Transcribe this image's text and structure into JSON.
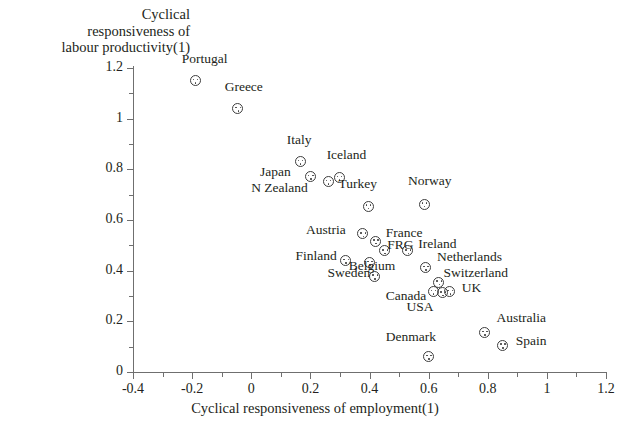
{
  "chart_data": {
    "type": "scatter",
    "title": "",
    "xlabel": "Cyclical responsiveness of employment(1)",
    "ylabel": "Cyclical\nresponsiveness of\nlabour productivity(1)",
    "xlim": [
      -0.4,
      1.2
    ],
    "ylim": [
      0,
      1.2
    ],
    "xticks": [
      "-0.4",
      "-0.2",
      "0",
      "0.2",
      "0.4",
      "0.6",
      "0.8",
      "1",
      "1.2"
    ],
    "xtick_values": [
      -0.4,
      -0.2,
      0,
      0.2,
      0.4,
      0.6,
      0.8,
      1,
      1.2
    ],
    "yticks": [
      "0",
      "0.2",
      "0.4",
      "0.6",
      "0.8",
      "1",
      "1.2"
    ],
    "ytick_values": [
      0,
      0.2,
      0.4,
      0.6,
      0.8,
      1,
      1.2
    ],
    "minor_ticks": true,
    "grid": false,
    "legend": false,
    "marker": "circle-with-three-dots",
    "points": [
      {
        "label": "Portugal",
        "x": -0.19,
        "y": 1.15,
        "lx": -0.235,
        "ly": 1.235,
        "anchor": "start"
      },
      {
        "label": "Greece",
        "x": -0.045,
        "y": 1.04,
        "lx": -0.09,
        "ly": 1.125,
        "anchor": "start"
      },
      {
        "label": "Italy",
        "x": 0.165,
        "y": 0.83,
        "lx": 0.12,
        "ly": 0.915,
        "anchor": "start"
      },
      {
        "label": "Japan",
        "x": 0.2,
        "y": 0.772,
        "lx": 0.03,
        "ly": 0.79,
        "anchor": "start"
      },
      {
        "label": "N Zealand",
        "x": 0.26,
        "y": 0.752,
        "lx": 0.0,
        "ly": 0.726,
        "anchor": "start"
      },
      {
        "label": "Iceland",
        "x": 0.297,
        "y": 0.768,
        "lx": 0.255,
        "ly": 0.855,
        "anchor": "start"
      },
      {
        "label": "Turkey",
        "x": 0.395,
        "y": 0.655,
        "lx": 0.295,
        "ly": 0.742,
        "anchor": "start"
      },
      {
        "label": "Norway",
        "x": 0.585,
        "y": 0.663,
        "lx": 0.53,
        "ly": 0.752,
        "anchor": "start"
      },
      {
        "label": "Austria",
        "x": 0.378,
        "y": 0.545,
        "lx": 0.185,
        "ly": 0.562,
        "anchor": "start"
      },
      {
        "label": "France",
        "x": 0.42,
        "y": 0.517,
        "lx": 0.455,
        "ly": 0.548,
        "anchor": "start"
      },
      {
        "label": "FRG",
        "x": 0.452,
        "y": 0.478,
        "lx": 0.46,
        "ly": 0.502,
        "anchor": "start"
      },
      {
        "label": "Ireland",
        "x": 0.53,
        "y": 0.478,
        "lx": 0.565,
        "ly": 0.505,
        "anchor": "start"
      },
      {
        "label": "Finland",
        "x": 0.32,
        "y": 0.44,
        "lx": 0.15,
        "ly": 0.456,
        "anchor": "start"
      },
      {
        "label": "Belgium",
        "x": 0.4,
        "y": 0.432,
        "lx": 0.33,
        "ly": 0.42,
        "anchor": "start"
      },
      {
        "label": "Sweden",
        "x": 0.418,
        "y": 0.378,
        "lx": 0.258,
        "ly": 0.39,
        "anchor": "start"
      },
      {
        "label": "Netherlands",
        "x": 0.59,
        "y": 0.412,
        "lx": 0.628,
        "ly": 0.452,
        "anchor": "start"
      },
      {
        "label": "Switzerland",
        "x": 0.635,
        "y": 0.355,
        "lx": 0.65,
        "ly": 0.392,
        "anchor": "start"
      },
      {
        "label": "Canada",
        "x": 0.615,
        "y": 0.318,
        "lx": 0.455,
        "ly": 0.3,
        "anchor": "start"
      },
      {
        "label": "USA",
        "x": 0.648,
        "y": 0.312,
        "lx": 0.525,
        "ly": 0.258,
        "anchor": "start"
      },
      {
        "label": "UK",
        "x": 0.672,
        "y": 0.318,
        "lx": 0.712,
        "ly": 0.332,
        "anchor": "start"
      },
      {
        "label": "Denmark",
        "x": 0.6,
        "y": 0.06,
        "lx": 0.455,
        "ly": 0.14,
        "anchor": "start"
      },
      {
        "label": "Australia",
        "x": 0.79,
        "y": 0.155,
        "lx": 0.83,
        "ly": 0.212,
        "anchor": "start"
      },
      {
        "label": "Spain",
        "x": 0.85,
        "y": 0.105,
        "lx": 0.895,
        "ly": 0.122,
        "anchor": "start"
      }
    ]
  },
  "colors": {
    "axis": "#6f6f6f",
    "text": "#231f20",
    "marker": "#3d3d3d",
    "background": "#ffffff"
  }
}
